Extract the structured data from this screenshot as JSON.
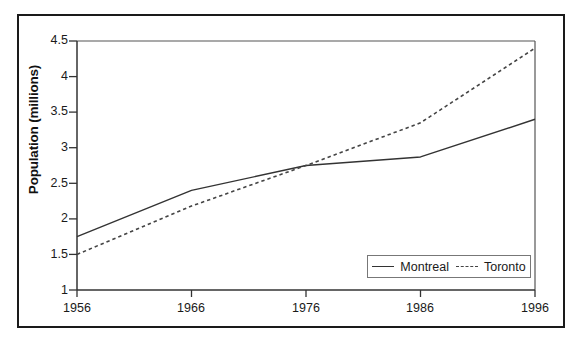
{
  "chart_data": {
    "type": "line",
    "title": "",
    "xlabel": "",
    "ylabel": "Population (millions)",
    "x": [
      1956,
      1966,
      1976,
      1986,
      1996
    ],
    "categories": [
      "1956",
      "1966",
      "1976",
      "1986",
      "1996"
    ],
    "xlim": [
      1956,
      1996
    ],
    "ylim": [
      1,
      4.5
    ],
    "ytick_labels": [
      "4.5",
      "4",
      "3.5",
      "3",
      "2.5",
      "2",
      "1.5",
      "1"
    ],
    "ytick_values": [
      4.5,
      4,
      3.5,
      3,
      2.5,
      2,
      1.5,
      1
    ],
    "grid": false,
    "legend_position": "bottom-right",
    "series": [
      {
        "name": "Montreal",
        "style": "solid",
        "color": "#333333",
        "values": [
          1.75,
          2.4,
          2.75,
          2.87,
          3.4
        ]
      },
      {
        "name": "Toronto",
        "style": "dashed",
        "color": "#444444",
        "values": [
          1.5,
          2.18,
          2.75,
          3.35,
          4.4
        ]
      }
    ]
  },
  "axis": {
    "y_title": "Population (millions)",
    "y_ticks": [
      "4.5",
      "4",
      "3.5",
      "3",
      "2.5",
      "2",
      "1.5",
      "1"
    ],
    "x_ticks": [
      "1956",
      "1966",
      "1976",
      "1986",
      "1996"
    ]
  },
  "legend": {
    "entries": [
      {
        "label": "Montreal"
      },
      {
        "label": "Toronto"
      }
    ]
  },
  "colors": {
    "frame": "#1a1a1a",
    "axis": "#333333",
    "montreal": "#333333",
    "toronto": "#444444"
  }
}
